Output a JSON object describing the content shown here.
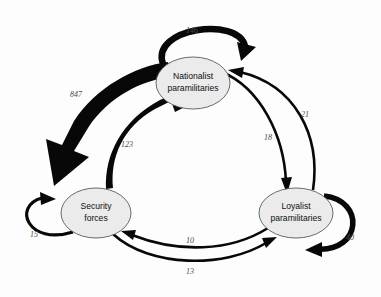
{
  "diagram": {
    "type": "directed-graph",
    "nodes": [
      {
        "id": "nationalist",
        "label_line1": "Nationalist",
        "label_line2": "paramilitaries",
        "cx": 193,
        "cy": 83,
        "rx": 37,
        "ry": 26
      },
      {
        "id": "security",
        "label_line1": "Security",
        "label_line2": "forces",
        "cx": 96,
        "cy": 213,
        "rx": 35,
        "ry": 25
      },
      {
        "id": "loyalist",
        "label_line1": "Loyalist",
        "label_line2": "paramilitaries",
        "cx": 296,
        "cy": 213,
        "rx": 37,
        "ry": 25
      }
    ],
    "edges": [
      {
        "id": "nationalist-self",
        "from": "nationalist",
        "to": "nationalist",
        "value": "146",
        "label_x": 192,
        "label_y": 31
      },
      {
        "id": "security-self",
        "from": "security",
        "to": "security",
        "value": "15",
        "label_x": 34,
        "label_y": 235
      },
      {
        "id": "loyalist-self",
        "from": "loyalist",
        "to": "loyalist",
        "value": "40",
        "label_x": 350,
        "label_y": 238
      },
      {
        "id": "nationalist-to-security",
        "from": "nationalist",
        "to": "security",
        "value": "847",
        "label_x": 76,
        "label_y": 95
      },
      {
        "id": "security-to-nationalist",
        "from": "security",
        "to": "nationalist",
        "value": "123",
        "label_x": 127,
        "label_y": 145
      },
      {
        "id": "nationalist-to-loyalist",
        "from": "nationalist",
        "to": "loyalist",
        "value": "18",
        "label_x": 268,
        "label_y": 138
      },
      {
        "id": "loyalist-to-nationalist",
        "from": "loyalist",
        "to": "nationalist",
        "value": "21",
        "label_x": 305,
        "label_y": 115
      },
      {
        "id": "loyalist-to-security",
        "from": "loyalist",
        "to": "security",
        "value": "10",
        "label_x": 190,
        "label_y": 241
      },
      {
        "id": "security-to-loyalist",
        "from": "security",
        "to": "loyalist",
        "value": "13",
        "label_x": 190,
        "label_y": 272
      }
    ],
    "colors": {
      "node_fill": "#ebebeb",
      "node_stroke": "#5a5a5a",
      "edge": "#080808",
      "label_text": "#4a4a4a",
      "background": "#fdfdfd"
    }
  }
}
